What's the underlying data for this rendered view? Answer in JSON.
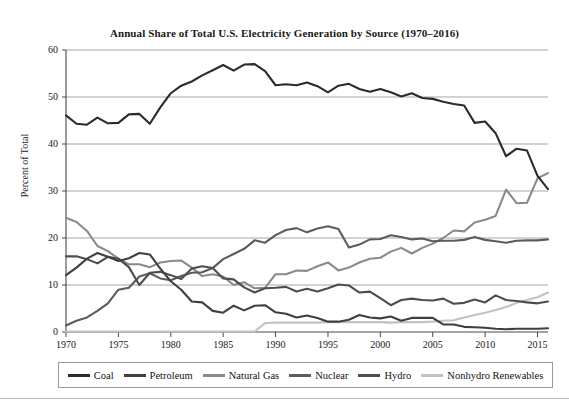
{
  "chart_data": {
    "type": "line",
    "title": "Annual Share of Total U.S. Electricity Generation by Source (1970–2016)",
    "xlabel": "",
    "ylabel": "Percent of Total",
    "xlim": [
      1970,
      2016
    ],
    "ylim": [
      0,
      60
    ],
    "grid": true,
    "grid_axis": "y",
    "legend_position": "bottom",
    "xticks": [
      1970,
      1975,
      1980,
      1985,
      1990,
      1995,
      2000,
      2005,
      2010,
      2015
    ],
    "yticks": [
      0,
      10,
      20,
      30,
      40,
      50,
      60
    ],
    "x": [
      1970,
      1971,
      1972,
      1973,
      1974,
      1975,
      1976,
      1977,
      1978,
      1979,
      1980,
      1981,
      1982,
      1983,
      1984,
      1985,
      1986,
      1987,
      1988,
      1989,
      1990,
      1991,
      1992,
      1993,
      1994,
      1995,
      1996,
      1997,
      1998,
      1999,
      2000,
      2001,
      2002,
      2003,
      2004,
      2005,
      2006,
      2007,
      2008,
      2009,
      2010,
      2011,
      2012,
      2013,
      2014,
      2015,
      2016
    ],
    "series": [
      {
        "name": "Coal",
        "color": "#2b2b2b",
        "values": [
          46.1,
          44.3,
          44.1,
          45.6,
          44.4,
          44.5,
          46.3,
          46.4,
          44.3,
          47.8,
          50.8,
          52.4,
          53.3,
          54.6,
          55.7,
          56.8,
          55.6,
          56.9,
          57.0,
          55.5,
          52.5,
          52.7,
          52.5,
          53.1,
          52.3,
          51.0,
          52.4,
          52.8,
          51.7,
          51.1,
          51.7,
          51.0,
          50.1,
          50.8,
          49.8,
          49.6,
          49.0,
          48.5,
          48.2,
          44.5,
          44.8,
          42.3,
          37.4,
          39.0,
          38.6,
          33.2,
          30.4
        ]
      },
      {
        "name": "Petroleum",
        "color": "#3f3f3f",
        "values": [
          12.1,
          13.7,
          15.6,
          16.8,
          16.0,
          15.1,
          15.7,
          16.8,
          16.5,
          13.5,
          10.8,
          9.0,
          6.5,
          6.3,
          4.5,
          4.1,
          5.6,
          4.6,
          5.6,
          5.7,
          4.2,
          3.9,
          3.1,
          3.5,
          3.0,
          2.2,
          2.2,
          2.6,
          3.6,
          3.1,
          2.9,
          3.3,
          2.4,
          3.0,
          3.0,
          3.0,
          1.6,
          1.6,
          1.1,
          1.0,
          0.9,
          0.7,
          0.6,
          0.7,
          0.7,
          0.7,
          0.8
        ]
      },
      {
        "name": "Natural Gas",
        "color": "#8a8a8a",
        "values": [
          24.3,
          23.4,
          21.5,
          18.3,
          17.2,
          15.6,
          14.4,
          14.4,
          13.8,
          14.8,
          15.1,
          15.2,
          13.7,
          11.9,
          12.3,
          11.8,
          10.0,
          10.6,
          9.3,
          9.4,
          12.3,
          12.3,
          13.1,
          13.0,
          14.0,
          14.8,
          13.1,
          13.7,
          14.8,
          15.6,
          15.8,
          17.1,
          17.9,
          16.7,
          17.9,
          18.8,
          20.0,
          21.6,
          21.4,
          23.3,
          23.9,
          24.7,
          30.3,
          27.4,
          27.5,
          32.7,
          33.8
        ]
      },
      {
        "name": "Nuclear",
        "color": "#5c5c5c",
        "values": [
          1.4,
          2.4,
          3.1,
          4.5,
          6.1,
          9.0,
          9.4,
          11.8,
          12.5,
          11.4,
          11.0,
          11.9,
          12.6,
          12.7,
          13.6,
          15.5,
          16.6,
          17.7,
          19.5,
          19.0,
          20.6,
          21.7,
          22.1,
          21.2,
          22.0,
          22.5,
          21.9,
          18.0,
          18.6,
          19.7,
          19.8,
          20.6,
          20.2,
          19.7,
          19.9,
          19.3,
          19.4,
          19.4,
          19.6,
          20.2,
          19.6,
          19.3,
          19.0,
          19.4,
          19.5,
          19.5,
          19.7
        ]
      },
      {
        "name": "Hydro",
        "color": "#4d4d4d",
        "values": [
          16.1,
          16.1,
          15.5,
          14.6,
          16.0,
          15.6,
          13.8,
          10.0,
          12.6,
          12.8,
          12.1,
          11.3,
          13.5,
          14.0,
          13.6,
          11.4,
          11.2,
          9.5,
          8.4,
          9.3,
          9.4,
          9.6,
          8.6,
          9.2,
          8.6,
          9.3,
          10.1,
          9.9,
          8.4,
          8.6,
          7.2,
          5.7,
          6.8,
          7.1,
          6.8,
          6.7,
          7.1,
          6.0,
          6.2,
          6.9,
          6.3,
          7.8,
          6.8,
          6.6,
          6.3,
          6.1,
          6.5
        ]
      },
      {
        "name": "Nonhydro Renewables",
        "color": "#c2c2c2",
        "values": [
          0.1,
          0.1,
          0.1,
          0.1,
          0.1,
          0.1,
          0.1,
          0.1,
          0.1,
          0.1,
          0.1,
          0.1,
          0.1,
          0.1,
          0.1,
          0.1,
          0.1,
          0.1,
          0.1,
          1.9,
          2.0,
          2.0,
          2.0,
          2.0,
          2.0,
          2.1,
          2.1,
          2.1,
          2.1,
          2.1,
          2.1,
          2.0,
          2.1,
          2.1,
          2.1,
          2.2,
          2.4,
          2.5,
          3.1,
          3.6,
          4.1,
          4.7,
          5.3,
          6.2,
          6.8,
          7.4,
          8.4
        ]
      }
    ]
  },
  "chart": {
    "title": "Annual Share of Total U.S. Electricity Generation by Source (1970–2016)",
    "ylabel": "Percent of Total",
    "ytick_labels": [
      "60",
      "50",
      "40",
      "30",
      "20",
      "10",
      "0"
    ],
    "xtick_labels": [
      "1970",
      "1975",
      "1980",
      "1985",
      "1990",
      "1995",
      "2000",
      "2005",
      "2010",
      "2015"
    ],
    "legend": [
      {
        "label": "Coal",
        "color": "#2b2b2b"
      },
      {
        "label": "Petroleum",
        "color": "#3f3f3f"
      },
      {
        "label": "Natural Gas",
        "color": "#8a8a8a"
      },
      {
        "label": "Nuclear",
        "color": "#5c5c5c"
      },
      {
        "label": "Hydro",
        "color": "#4d4d4d"
      },
      {
        "label": "Nonhydro Renewables",
        "color": "#c2c2c2"
      }
    ]
  }
}
